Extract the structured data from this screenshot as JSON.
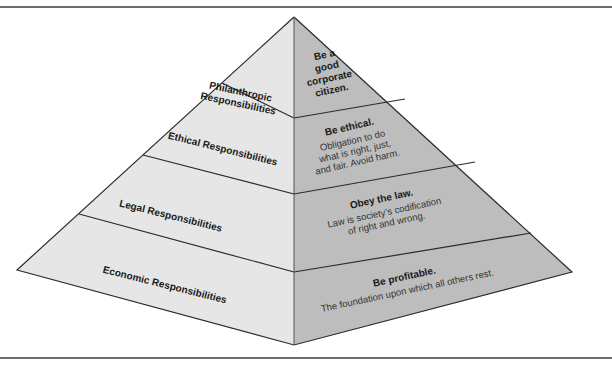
{
  "diagram": {
    "type": "pyramid",
    "colors": {
      "left_face": "#e6e6e6",
      "right_face": "#bdbdbd",
      "edge": "#2b2b2b",
      "rule": "#6e6e6e"
    },
    "tiers": [
      {
        "name": "Philanthropic Responsibilities",
        "name_lines": [
          "Philanthropic",
          "Responsibilities"
        ],
        "heading_lines": [
          "Be a",
          "good",
          "corporate",
          "citizen."
        ],
        "body_lines": []
      },
      {
        "name": "Ethical Responsibilities",
        "name_lines": [
          "Ethical Responsibilities"
        ],
        "heading_lines": [
          "Be ethical."
        ],
        "body_lines": [
          "Obligation to do",
          "what is right, just,",
          "and fair. Avoid harm."
        ]
      },
      {
        "name": "Legal Responsibilities",
        "name_lines": [
          "Legal Responsibilities"
        ],
        "heading_lines": [
          "Obey the law."
        ],
        "body_lines": [
          "Law is society’s codification",
          "of right and wrong."
        ]
      },
      {
        "name": "Economic Responsibilities",
        "name_lines": [
          "Economic Responsibilities"
        ],
        "heading_lines": [
          "Be profitable."
        ],
        "body_lines": [
          "The foundation upon which all others rest."
        ]
      }
    ]
  }
}
